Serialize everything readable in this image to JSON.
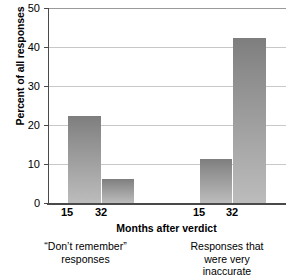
{
  "chart_data": {
    "type": "bar",
    "title": "",
    "xlabel": "Months after verdict",
    "ylabel": "Percent of all responses",
    "ylim": [
      0,
      50
    ],
    "yticks": [
      0,
      10,
      20,
      30,
      40,
      50
    ],
    "ytick_labels": [
      "0",
      "10",
      "20",
      "30",
      "40",
      "50"
    ],
    "grid": "horizontal",
    "legend": "none",
    "groups": [
      {
        "caption_lines": [
          "“Don’t remember”",
          "responses"
        ],
        "categories": [
          "15",
          "32"
        ],
        "values": [
          22.3,
          6.2
        ]
      },
      {
        "caption_lines": [
          "Responses that",
          "were very",
          "inaccurate"
        ],
        "categories": [
          "15",
          "32"
        ],
        "values": [
          11.4,
          42.2
        ]
      }
    ],
    "categories": [
      "15",
      "32",
      "15",
      "32"
    ],
    "values": [
      22.3,
      6.2,
      11.4,
      42.2
    ],
    "bar_color_top": "#7e7e7e",
    "bar_color_bottom": "#bcbcbc",
    "axis_color": "#4a4a4a",
    "grid_color": "#c8c8c8"
  }
}
